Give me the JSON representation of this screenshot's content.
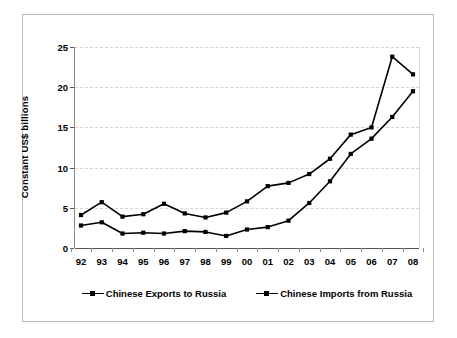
{
  "chart_data": {
    "type": "line",
    "title": "",
    "xlabel": "",
    "ylabel": "Constant US$ billions",
    "categories": [
      "92",
      "93",
      "94",
      "95",
      "96",
      "97",
      "98",
      "99",
      "00",
      "01",
      "02",
      "03",
      "04",
      "05",
      "06",
      "07",
      "08"
    ],
    "ylim": [
      0,
      25
    ],
    "yticks": [
      0,
      5,
      10,
      15,
      20,
      25
    ],
    "ytick_labels": [
      "0",
      "5",
      "10",
      "15",
      "20",
      "25"
    ],
    "grid": true,
    "grid_axis": "y",
    "legend_position": "bottom",
    "series": [
      {
        "name": "Chinese Exports to Russia",
        "color": "#000000",
        "marker": "square",
        "values": [
          4.1,
          5.7,
          3.9,
          4.2,
          5.5,
          4.3,
          3.8,
          4.4,
          5.8,
          7.7,
          8.1,
          9.2,
          11.1,
          14.1,
          15.0,
          23.8,
          21.6
        ]
      },
      {
        "name": "Chinese Imports from Russia",
        "color": "#000000",
        "marker": "square",
        "values": [
          2.8,
          3.2,
          1.8,
          1.9,
          1.8,
          2.1,
          2.0,
          1.5,
          2.3,
          2.6,
          3.4,
          5.6,
          8.3,
          11.7,
          13.6,
          16.3,
          19.5
        ]
      }
    ]
  },
  "legend": {
    "items": [
      {
        "label": "Chinese Exports to Russia",
        "marker": "square-line-marker"
      },
      {
        "label": "Chinese Imports from Russia",
        "marker": "square-line-marker"
      }
    ]
  },
  "axes": {
    "y_title": "Constant US$ billions"
  }
}
